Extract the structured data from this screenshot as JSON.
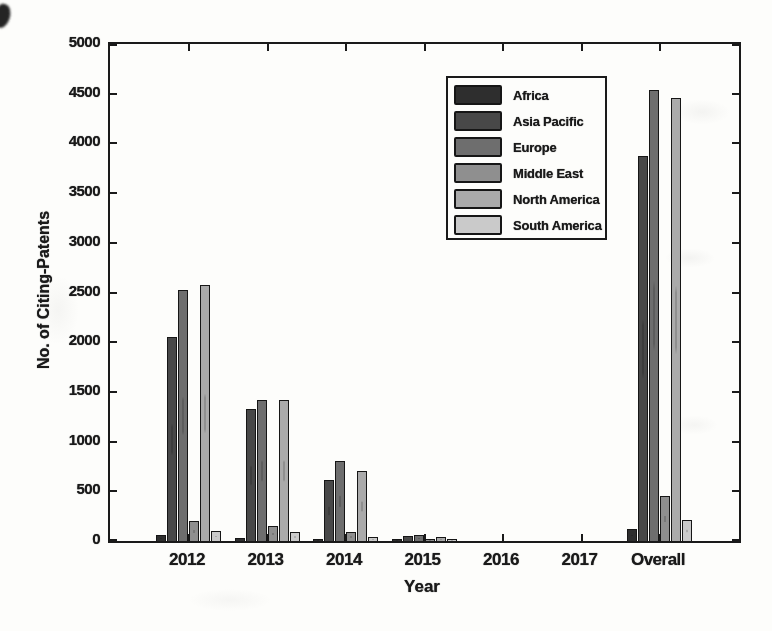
{
  "figure": {
    "background": "#fdfdfb",
    "ink": "#1a1a1a"
  },
  "chart_data": {
    "type": "bar",
    "title": "",
    "xlabel": "Year",
    "ylabel": "No. of Citing-Patents",
    "categories": [
      "2012",
      "2013",
      "2014",
      "2015",
      "2016",
      "2017",
      "Overall"
    ],
    "series": [
      {
        "name": "Africa",
        "color": "#2e2e2e",
        "values": [
          60,
          30,
          20,
          5,
          0,
          0,
          120
        ]
      },
      {
        "name": "Asia Pacific",
        "color": "#484848",
        "values": [
          2050,
          1330,
          610,
          55,
          0,
          0,
          3870
        ]
      },
      {
        "name": "Europe",
        "color": "#6e6e6e",
        "values": [
          2525,
          1420,
          800,
          65,
          0,
          0,
          4540
        ]
      },
      {
        "name": "Middle East",
        "color": "#8f8f8f",
        "values": [
          200,
          150,
          95,
          10,
          0,
          0,
          450
        ]
      },
      {
        "name": "North America",
        "color": "#aaaaaa",
        "values": [
          2575,
          1420,
          700,
          40,
          0,
          0,
          4460
        ]
      },
      {
        "name": "South America",
        "color": "#cacaca",
        "values": [
          100,
          90,
          45,
          5,
          0,
          0,
          210
        ]
      }
    ],
    "ylim": [
      0,
      5000
    ],
    "ytick_step": 500,
    "ytick_labels": [
      "0",
      "500",
      "1000",
      "1500",
      "2000",
      "2500",
      "3000",
      "3500",
      "4000",
      "4500",
      "5000"
    ],
    "grid": false,
    "legend_position": "inside-upper-center",
    "legend_entries": [
      "Africa",
      "Asia Pacific",
      "Europe",
      "Middle East",
      "North America",
      "South America"
    ]
  }
}
